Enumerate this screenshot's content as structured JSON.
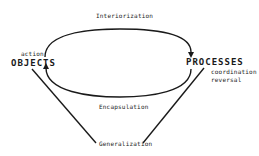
{
  "diagram": {
    "nodes": {
      "objects": "OBJECTS",
      "processes": "PROCESSES"
    },
    "annotations": {
      "action": "action",
      "coordination": "coordination",
      "reversal": "reversal"
    },
    "edges": {
      "interiorization": "Interiorization",
      "encapsulation": "Encapsulation",
      "generalization": "Generalization"
    },
    "colors": {
      "stroke": "#1a1a1a",
      "background": "#ffffff"
    }
  }
}
